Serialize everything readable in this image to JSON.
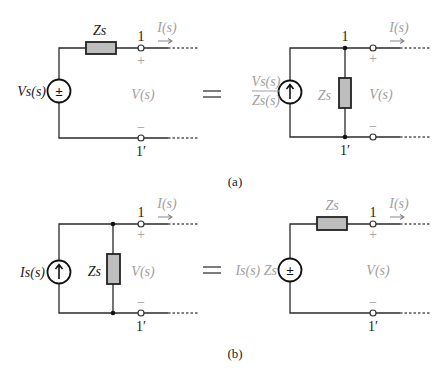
{
  "figure": {
    "panel_a": {
      "caption": "(a)",
      "left_circuit": {
        "source_type": "voltage",
        "source_label": "Vs(s)",
        "source_symbol": "±",
        "series_impedance": "Zs",
        "terminal_top": "1",
        "terminal_bottom": "1′",
        "current_label": "I(s)",
        "voltage_label": "V(s)",
        "plus": "+",
        "minus": "−"
      },
      "equals": "=",
      "right_circuit": {
        "source_type": "current",
        "source_label_numerator": "Vs(s)",
        "source_label_denominator": "Zs(s)",
        "source_symbol": "↑",
        "shunt_impedance": "Zs",
        "terminal_top": "1",
        "terminal_bottom": "1′",
        "current_label": "I(s)",
        "voltage_label": "V(s)",
        "plus": "+",
        "minus": "−"
      }
    },
    "panel_b": {
      "caption": "(b)",
      "left_circuit": {
        "source_type": "current",
        "source_label": "Is(s)",
        "source_symbol": "↑",
        "shunt_impedance": "Zs",
        "terminal_top": "1",
        "terminal_bottom": "1′",
        "current_label": "I(s)",
        "voltage_label": "V(s)",
        "plus": "+",
        "minus": "−"
      },
      "equals": "=",
      "right_circuit": {
        "source_type": "voltage",
        "source_label": "Is(s) Zs",
        "source_symbol": "±",
        "series_impedance": "Zs",
        "terminal_top": "1",
        "terminal_bottom": "1′",
        "current_label": "I(s)",
        "voltage_label": "V(s)",
        "plus": "+",
        "minus": "−"
      }
    },
    "colors": {
      "wire": "#2a2a2a",
      "resistor_fill": "#bdbdbd",
      "label_gray": "#a0a0a0",
      "background": "#ffffff"
    }
  }
}
